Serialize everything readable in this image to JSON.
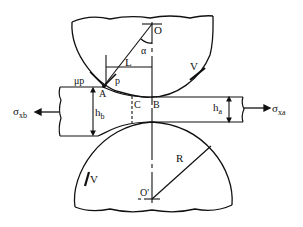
{
  "diagram": {
    "colors": {
      "ink": "#111111",
      "background": "#ffffff"
    },
    "labels": {
      "O": "O",
      "O_prime": "O'",
      "alpha": "α",
      "L": "L",
      "mu_p": "μp",
      "p": "p",
      "A": "A",
      "B": "B",
      "C": "C",
      "h_b": "h",
      "h_b_sub": "b",
      "h_a": "h",
      "h_a_sub": "a",
      "R": "R",
      "V_top": "V",
      "V_bottom": "V",
      "sigma_xb": "σ",
      "sigma_xb_sub": "xb",
      "sigma_xa": "σ",
      "sigma_xa_sub": "xa"
    }
  }
}
